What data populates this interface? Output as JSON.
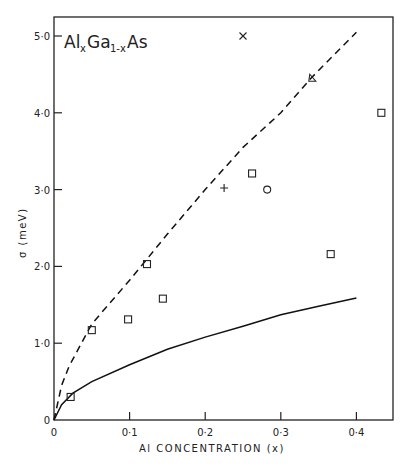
{
  "chart_data": {
    "type": "scatter",
    "title": "",
    "annotation": {
      "formula_main": "Al",
      "sub_x": "x",
      "ga": "Ga",
      "sub_1x": "1-x",
      "as": "As"
    },
    "xlabel": "Al CONCENTRATION (x)",
    "ylabel": "σ (meV)",
    "xlim": [
      0,
      0.45
    ],
    "ylim": [
      0,
      5.2
    ],
    "grid": false,
    "x_ticks": [
      {
        "v": 0,
        "label": "0"
      },
      {
        "v": 0.1,
        "label": "0·1"
      },
      {
        "v": 0.2,
        "label": "0·2"
      },
      {
        "v": 0.3,
        "label": "0·3"
      },
      {
        "v": 0.4,
        "label": "0·4"
      }
    ],
    "y_ticks": [
      {
        "v": 0,
        "label": "0"
      },
      {
        "v": 1,
        "label": "1·0"
      },
      {
        "v": 2,
        "label": "2·0"
      },
      {
        "v": 3,
        "label": "3·0"
      },
      {
        "v": 4,
        "label": "4·0"
      },
      {
        "v": 5,
        "label": "5·0"
      }
    ],
    "series": [
      {
        "name": "squares",
        "marker": "square",
        "points": [
          [
            0.022,
            0.3
          ],
          [
            0.05,
            1.17
          ],
          [
            0.098,
            1.31
          ],
          [
            0.123,
            2.03
          ],
          [
            0.144,
            1.58
          ],
          [
            0.262,
            3.21
          ],
          [
            0.366,
            2.16
          ],
          [
            0.433,
            4.0
          ]
        ]
      },
      {
        "name": "plus",
        "marker": "plus",
        "points": [
          [
            0.225,
            3.02
          ]
        ]
      },
      {
        "name": "circle",
        "marker": "circle",
        "points": [
          [
            0.282,
            3.0
          ]
        ]
      },
      {
        "name": "triangle",
        "marker": "triangle",
        "points": [
          [
            0.341,
            4.45
          ]
        ]
      },
      {
        "name": "cross",
        "marker": "x",
        "points": [
          [
            0.25,
            5.0
          ]
        ]
      },
      {
        "name": "dashed-curve",
        "style": "dashed-line",
        "points": [
          [
            0,
            0
          ],
          [
            0.01,
            0.45
          ],
          [
            0.02,
            0.7
          ],
          [
            0.05,
            1.25
          ],
          [
            0.1,
            1.82
          ],
          [
            0.15,
            2.42
          ],
          [
            0.2,
            3.0
          ],
          [
            0.25,
            3.55
          ],
          [
            0.3,
            4.0
          ],
          [
            0.34,
            4.45
          ],
          [
            0.4,
            5.05
          ]
        ]
      },
      {
        "name": "solid-curve",
        "style": "solid-line",
        "points": [
          [
            0,
            0
          ],
          [
            0.01,
            0.2
          ],
          [
            0.025,
            0.35
          ],
          [
            0.05,
            0.5
          ],
          [
            0.1,
            0.72
          ],
          [
            0.15,
            0.92
          ],
          [
            0.2,
            1.08
          ],
          [
            0.25,
            1.22
          ],
          [
            0.3,
            1.37
          ],
          [
            0.35,
            1.48
          ],
          [
            0.4,
            1.59
          ]
        ]
      }
    ]
  }
}
